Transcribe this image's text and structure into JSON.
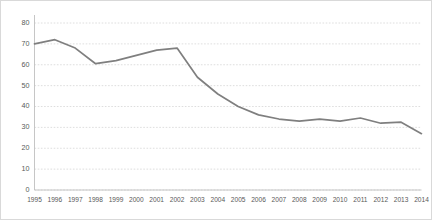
{
  "chart_data": {
    "type": "line",
    "title": "",
    "subtitle": "",
    "xlabel": "",
    "ylabel": "",
    "categories": [
      "1995",
      "1996",
      "1997",
      "1998",
      "1999",
      "2000",
      "2001",
      "2002",
      "2003",
      "2004",
      "2005",
      "2006",
      "2007",
      "2008",
      "2009",
      "2010",
      "2011",
      "2012",
      "2013",
      "2014"
    ],
    "values": [
      70,
      72,
      68,
      60.5,
      62,
      64.5,
      67,
      68,
      54,
      46,
      40,
      36,
      34,
      33,
      34,
      33,
      34.5,
      32,
      32.5,
      27
    ],
    "series": [
      {
        "name": "series-1",
        "values": [
          70,
          72,
          68,
          60.5,
          62,
          64.5,
          67,
          68,
          54,
          46,
          40,
          36,
          34,
          33,
          34,
          33,
          34.5,
          32,
          32.5,
          27
        ],
        "color": "#7f7f7f"
      }
    ],
    "ylim": [
      0,
      80
    ],
    "yticks": [
      0,
      10,
      20,
      30,
      40,
      50,
      60,
      70,
      80
    ],
    "ytick_labels": [
      "0",
      "10",
      "20",
      "30",
      "40",
      "50",
      "60",
      "70",
      "80"
    ],
    "xticks": [
      "1995",
      "1996",
      "1997",
      "1998",
      "1999",
      "2000",
      "2001",
      "2002",
      "2003",
      "2004",
      "2005",
      "2006",
      "2007",
      "2008",
      "2009",
      "2010",
      "2011",
      "2012",
      "2013",
      "2014"
    ],
    "grid": true,
    "grid_axis": "y",
    "legend": false,
    "legend_position": "none",
    "annotations": [],
    "colors": {
      "line": "#7f7f7f",
      "grid": "#d6d6d6",
      "axis": "#bfbfbf",
      "tick_text": "#595959",
      "frame_border": "#d9d9d9",
      "background": "#ffffff"
    }
  }
}
